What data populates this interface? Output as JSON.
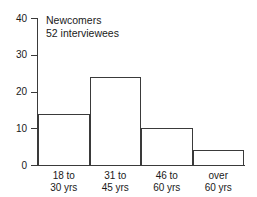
{
  "chart_data": {
    "type": "bar",
    "title": "",
    "annotation_lines": [
      "Newcomers",
      "52 interviewees"
    ],
    "annotation": "Newcomers\n52 interviewees",
    "categories": [
      "18 to\n30 yrs",
      "31 to\n45 yrs",
      "46 to\n60 yrs",
      "over\n60 yrs"
    ],
    "category_lines": [
      [
        "18 to",
        "30 yrs"
      ],
      [
        "31 to",
        "45 yrs"
      ],
      [
        "46 to",
        "60 yrs"
      ],
      [
        "over",
        "60 yrs"
      ]
    ],
    "values": [
      14,
      24,
      10,
      4
    ],
    "xlabel": "",
    "ylabel": "",
    "ylim": [
      0,
      40
    ],
    "yticks": [
      0,
      10,
      20,
      30,
      40
    ],
    "ytick_labels": [
      "0",
      "10",
      "20",
      "30",
      "40"
    ],
    "grid": false,
    "legend": false,
    "bar_style": "outlined-adjacent",
    "colors": {
      "line": "#3a3a3a",
      "fill": "#ffffff",
      "text": "#1a1a1a",
      "background": "#ffffff"
    }
  }
}
